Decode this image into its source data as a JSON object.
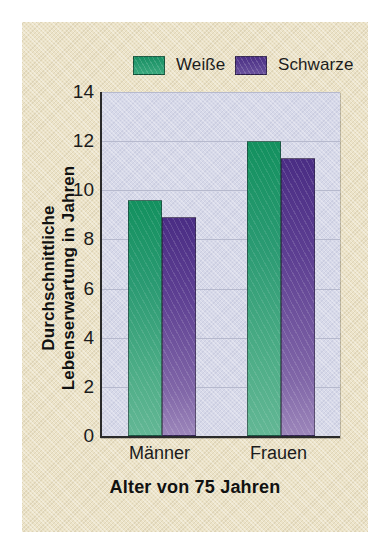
{
  "chart_data": {
    "type": "bar",
    "title": "",
    "xlabel": "Alter von 75 Jahren",
    "ylabel_lines": [
      "Durchschnittliche",
      "Lebenserwartung in Jahren"
    ],
    "categories": [
      "Männer",
      "Frauen"
    ],
    "series": [
      {
        "name": "Weiße",
        "color": "#2a9a72",
        "values": [
          9.6,
          12.0
        ]
      },
      {
        "name": "Schwarze",
        "color": "#5d3f92",
        "values": [
          8.9,
          11.3
        ]
      }
    ],
    "ylim": [
      0,
      14
    ],
    "ytick_values": [
      0,
      2,
      4,
      6,
      8,
      10,
      12,
      14
    ],
    "ytick_labels": [
      "0",
      "2",
      "4",
      "6",
      "8",
      "10",
      "12",
      "14"
    ],
    "grid": true,
    "legend_position": "top",
    "plot_background_color": "#d7d9e9",
    "panel_background_color": "#ece3c8"
  }
}
